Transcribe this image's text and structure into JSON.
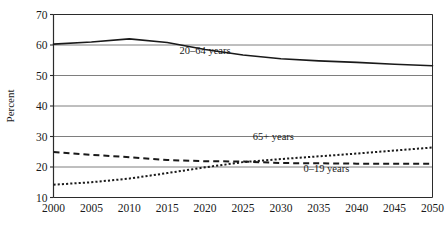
{
  "chart_data": {
    "type": "line",
    "title": "",
    "subtitle": "",
    "xlabel": "",
    "ylabel": "Percent",
    "xlim": [
      2000,
      2050
    ],
    "ylim": [
      10,
      70
    ],
    "grid": true,
    "grid_axis": "y",
    "legend_position": "inline-annotations",
    "x_ticks": [
      "2000",
      "2005",
      "2010",
      "2015",
      "2020",
      "2025",
      "2030",
      "2035",
      "2040",
      "2045",
      "2050"
    ],
    "y_ticks": [
      "10",
      "20",
      "30",
      "40",
      "50",
      "60",
      "70"
    ],
    "x": [
      2000,
      2005,
      2010,
      2015,
      2020,
      2025,
      2030,
      2035,
      2040,
      2045,
      2050
    ],
    "series": [
      {
        "name": "20–64 years",
        "style": "solid",
        "color": "#1a1a1a",
        "label_x": 2020,
        "label_y": 57,
        "values": [
          60.3,
          61.0,
          62.0,
          60.8,
          58.5,
          56.7,
          55.5,
          54.8,
          54.3,
          53.7,
          53.2
        ]
      },
      {
        "name": "65+ years",
        "style": "dotted",
        "color": "#1a1a1a",
        "label_x": 2029,
        "label_y": 29,
        "values": [
          14.2,
          15.0,
          16.2,
          18.0,
          19.9,
          21.6,
          22.6,
          23.5,
          24.4,
          25.4,
          26.4
        ]
      },
      {
        "name": "0–19 years",
        "style": "dashed",
        "color": "#1a1a1a",
        "label_x": 2036,
        "label_y": 18.2,
        "values": [
          24.9,
          24.0,
          23.2,
          22.3,
          21.9,
          21.8,
          21.3,
          21.2,
          21.1,
          21.1,
          21.1
        ]
      }
    ]
  },
  "axis": {
    "y_title": "Percent"
  },
  "labels": {
    "series_20_64": "20–64 years",
    "series_65plus": "65+ years",
    "series_0_19": "0–19 years"
  },
  "colors": {
    "line": "#1a1a1a",
    "grid": "#6f6f6f",
    "axis": "#2b2b2b",
    "background": "#ffffff"
  }
}
